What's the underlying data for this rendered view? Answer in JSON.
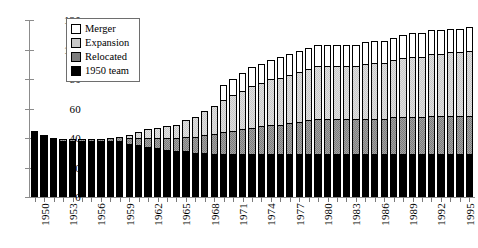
{
  "chart_data": {
    "type": "bar",
    "stacked": true,
    "title": "",
    "subtitle": "",
    "xlabel": "",
    "ylabel": "",
    "ylim": [
      0,
      120
    ],
    "yticks": [
      0,
      20,
      40,
      60,
      80,
      100,
      120
    ],
    "grid": false,
    "legend_position": "top-left-inside",
    "legend": [
      "Merger",
      "Expansion",
      "Relocated",
      "1950 team"
    ],
    "colors": {
      "merger": "#ffffff",
      "expansion": "#c9c9c9",
      "relocated": "#7d7d7d",
      "team1950": "#000000",
      "axis": "#8c8c8c",
      "outline": "#000000",
      "background": "#ffffff"
    },
    "categories": [
      "1950",
      "1951",
      "1952",
      "1953",
      "1954",
      "1955",
      "1956",
      "1957",
      "1958",
      "1959",
      "1960",
      "1961",
      "1962",
      "1963",
      "1964",
      "1965",
      "1966",
      "1967",
      "1968",
      "1969",
      "1970",
      "1971",
      "1972",
      "1973",
      "1974",
      "1975",
      "1976",
      "1977",
      "1978",
      "1979",
      "1980",
      "1981",
      "1982",
      "1983",
      "1984",
      "1985",
      "1986",
      "1987",
      "1988",
      "1989",
      "1990",
      "1991",
      "1992",
      "1993",
      "1994",
      "1995",
      "1996"
    ],
    "xtick_labels_shown": [
      "1950",
      "1953",
      "1956",
      "1959",
      "1962",
      "1965",
      "1968",
      "1971",
      "1974",
      "1977",
      "1980",
      "1983",
      "1986",
      "1989",
      "1992",
      "1995"
    ],
    "xtick_label_interval": 3,
    "series": [
      {
        "name": "1950 team",
        "values": [
          45,
          42,
          40,
          38,
          38,
          38,
          38,
          38,
          38,
          38,
          36,
          35,
          34,
          33,
          32,
          31,
          31,
          30,
          30,
          29,
          29,
          29,
          29,
          29,
          29,
          29,
          29,
          29,
          29,
          29,
          29,
          29,
          29,
          29,
          29,
          29,
          29,
          29,
          29,
          29,
          29,
          29,
          29,
          29,
          29,
          29,
          29
        ]
      },
      {
        "name": "Relocated",
        "values": [
          0,
          0,
          0,
          1,
          1,
          1,
          1,
          1,
          2,
          3,
          4,
          5,
          6,
          7,
          8,
          9,
          10,
          11,
          12,
          14,
          15,
          16,
          17,
          18,
          19,
          20,
          20,
          21,
          22,
          23,
          24,
          24,
          24,
          24,
          24,
          24,
          24,
          24,
          25,
          25,
          25,
          25,
          26,
          26,
          26,
          26,
          26
        ]
      },
      {
        "name": "Expansion",
        "values": [
          0,
          0,
          0,
          0,
          0,
          0,
          0,
          0,
          0,
          0,
          2,
          4,
          6,
          7,
          8,
          9,
          11,
          13,
          16,
          19,
          22,
          24,
          26,
          28,
          29,
          31,
          32,
          33,
          34,
          35,
          36,
          36,
          36,
          36,
          36,
          37,
          38,
          38,
          39,
          40,
          41,
          41,
          42,
          42,
          43,
          43,
          44
        ]
      },
      {
        "name": "Merger",
        "values": [
          0,
          0,
          0,
          0,
          0,
          0,
          0,
          0,
          0,
          0,
          0,
          0,
          0,
          0,
          0,
          0,
          0,
          0,
          0,
          0,
          10,
          11,
          12,
          13,
          13,
          13,
          14,
          14,
          14,
          14,
          14,
          14,
          14,
          14,
          14,
          15,
          15,
          15,
          15,
          16,
          16,
          16,
          16,
          16,
          16,
          16,
          16
        ]
      }
    ],
    "totals": [
      45,
      42,
      40,
      39,
      39,
      39,
      39,
      39,
      40,
      41,
      42,
      44,
      46,
      47,
      48,
      49,
      52,
      54,
      58,
      62,
      76,
      80,
      84,
      88,
      90,
      93,
      95,
      97,
      99,
      101,
      103,
      103,
      103,
      103,
      103,
      105,
      106,
      106,
      107,
      110,
      111,
      111,
      113,
      113,
      114,
      114,
      115
    ]
  }
}
